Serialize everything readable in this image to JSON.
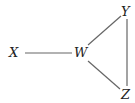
{
  "diagram": {
    "type": "graph",
    "nodes": [
      {
        "id": "X",
        "label": "X",
        "x": 13,
        "y": 57
      },
      {
        "id": "W",
        "label": "W",
        "x": 81,
        "y": 57
      },
      {
        "id": "Y",
        "label": "Y",
        "x": 125,
        "y": 15
      },
      {
        "id": "Z",
        "label": "Z",
        "x": 125,
        "y": 99
      }
    ],
    "edges": [
      {
        "from": "X",
        "to": "W"
      },
      {
        "from": "W",
        "to": "Y"
      },
      {
        "from": "W",
        "to": "Z"
      },
      {
        "from": "Y",
        "to": "Z"
      }
    ]
  }
}
